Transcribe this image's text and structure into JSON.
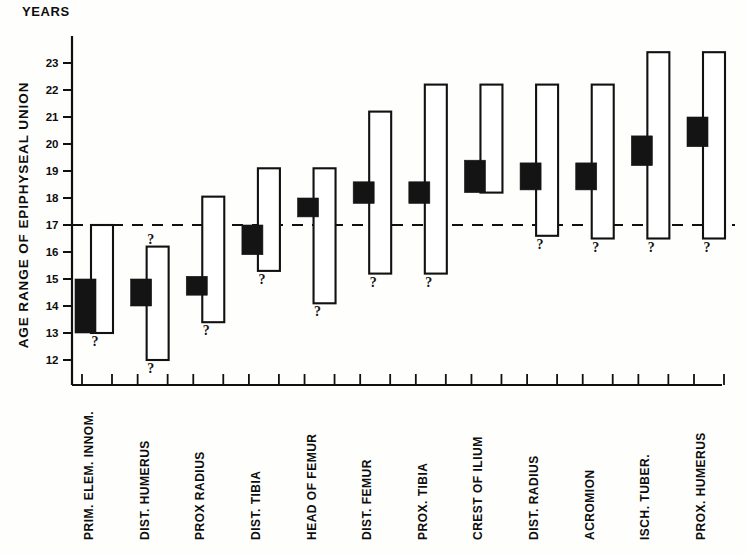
{
  "chart_data": {
    "type": "bar",
    "title": "YEARS",
    "xlabel": "",
    "ylabel": "AGE  RANGE  OF  EPIPHYSEAL  UNION",
    "ylim": [
      11.6,
      23.7
    ],
    "yticks": [
      12,
      13,
      14,
      15,
      16,
      17,
      18,
      19,
      20,
      21,
      22,
      23
    ],
    "ytick_labels": [
      "12",
      "13",
      "14",
      "15",
      "16",
      "17",
      "18",
      "19",
      "20",
      "21",
      "22",
      "23"
    ],
    "grid": false,
    "legend": "none",
    "reference_line": {
      "value": 17,
      "style": "dashed",
      "label": ""
    },
    "uncertainty_marker": "?",
    "categories": [
      "PRIM. ELEM. INNOM.",
      "DIST. HUMERUS",
      "PROX  RADIUS",
      "DIST. TIBIA",
      "HEAD OF FEMUR",
      "DIST. FEMUR",
      "PROX. TIBIA",
      "CREST OF ILIUM",
      "DIST. RADIUS",
      "ACROMION",
      "ISCH. TUBER.",
      "PROX. HUMERUS"
    ],
    "series": [
      {
        "name": "Total age range of epiphyseal union",
        "style": "open-outline",
        "bars": [
          {
            "category": "PRIM. ELEM. INNOM.",
            "top": 17.0,
            "bottom": 13.0,
            "q_top": false,
            "q_bottom": true
          },
          {
            "category": "DIST. HUMERUS",
            "top": 16.2,
            "bottom": 12.0,
            "q_top": true,
            "q_bottom": true
          },
          {
            "category": "PROX  RADIUS",
            "top": 18.05,
            "bottom": 13.4,
            "q_top": false,
            "q_bottom": true
          },
          {
            "category": "DIST. TIBIA",
            "top": 19.1,
            "bottom": 15.3,
            "q_top": false,
            "q_bottom": true
          },
          {
            "category": "HEAD OF FEMUR",
            "top": 19.1,
            "bottom": 14.1,
            "q_top": false,
            "q_bottom": true
          },
          {
            "category": "DIST. FEMUR",
            "top": 21.2,
            "bottom": 15.2,
            "q_top": false,
            "q_bottom": true
          },
          {
            "category": "PROX. TIBIA",
            "top": 22.2,
            "bottom": 15.2,
            "q_top": false,
            "q_bottom": true
          },
          {
            "category": "CREST OF ILIUM",
            "top": 22.2,
            "bottom": 18.2,
            "q_top": false,
            "q_bottom": false
          },
          {
            "category": "DIST. RADIUS",
            "top": 22.2,
            "bottom": 16.6,
            "q_top": false,
            "q_bottom": true
          },
          {
            "category": "ACROMION",
            "top": 22.2,
            "bottom": 16.5,
            "q_top": false,
            "q_bottom": true
          },
          {
            "category": "ISCH. TUBER.",
            "top": 23.4,
            "bottom": 16.5,
            "q_top": false,
            "q_bottom": true
          },
          {
            "category": "PROX. HUMERUS",
            "top": 23.4,
            "bottom": 16.5,
            "q_top": false,
            "q_bottom": true
          }
        ]
      },
      {
        "name": "Most frequent age of epiphyseal union",
        "style": "solid-black",
        "bars": [
          {
            "category": "PRIM. ELEM. INNOM.",
            "top": 15.0,
            "bottom": 13.0
          },
          {
            "category": "DIST. HUMERUS",
            "top": 15.0,
            "bottom": 14.0
          },
          {
            "category": "PROX  RADIUS",
            "top": 15.1,
            "bottom": 14.4
          },
          {
            "category": "DIST. TIBIA",
            "top": 17.0,
            "bottom": 15.9
          },
          {
            "category": "HEAD OF FEMUR",
            "top": 18.0,
            "bottom": 17.3
          },
          {
            "category": "DIST. FEMUR",
            "top": 18.6,
            "bottom": 17.8
          },
          {
            "category": "PROX. TIBIA",
            "top": 18.6,
            "bottom": 17.8
          },
          {
            "category": "CREST OF ILIUM",
            "top": 19.4,
            "bottom": 18.2
          },
          {
            "category": "DIST. RADIUS",
            "top": 19.3,
            "bottom": 18.3
          },
          {
            "category": "ACROMION",
            "top": 19.3,
            "bottom": 18.3
          },
          {
            "category": "ISCH. TUBER.",
            "top": 20.3,
            "bottom": 19.2
          },
          {
            "category": "PROX. HUMERUS",
            "top": 21.0,
            "bottom": 19.9
          }
        ]
      }
    ],
    "colors": {
      "solid_bar": "#141414",
      "outline_bar_fill": "#ffffff",
      "outline_bar_stroke": "#111111",
      "axis": "#101010",
      "reference_line": "#111111",
      "text": "#0d0d0d",
      "background": "#fefefc"
    }
  }
}
